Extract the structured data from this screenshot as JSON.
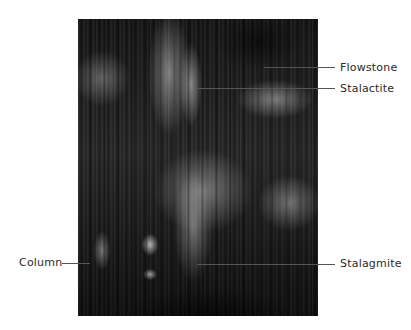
{
  "figure": {
    "labels": [
      {
        "id": "flowstone",
        "text": "Flowstone",
        "side": "right"
      },
      {
        "id": "stalactite",
        "text": "Stalactite",
        "side": "right"
      },
      {
        "id": "column",
        "text": "Column",
        "side": "left"
      },
      {
        "id": "stalagmite",
        "text": "Stalagmite",
        "side": "right"
      }
    ]
  },
  "colors": {
    "background": "#ffffff",
    "label_text": "#2a2a2a",
    "leader_line": "#555555"
  }
}
